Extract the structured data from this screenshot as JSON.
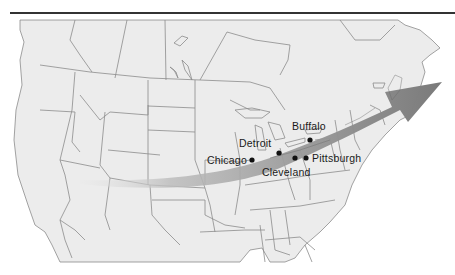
{
  "map": {
    "title": "",
    "arrow": {
      "description": "Migration / movement arrow sweeping west to east across the northern United States",
      "color_light": "#cfcfcf",
      "color_dark": "#8a8a8a"
    },
    "colors": {
      "land": "#ececec",
      "border": "#8c8c8c",
      "rule": "#333333",
      "city_dot": "#111111",
      "label": "#1a1a1a"
    },
    "cities": [
      {
        "name": "Buffalo",
        "x": 310,
        "y": 140
      },
      {
        "name": "Detroit",
        "x": 279,
        "y": 153
      },
      {
        "name": "Chicago",
        "x": 252,
        "y": 160
      },
      {
        "name": "Cleveland",
        "x": 295,
        "y": 158
      },
      {
        "name": "Pittsburgh",
        "x": 306,
        "y": 158
      }
    ]
  }
}
